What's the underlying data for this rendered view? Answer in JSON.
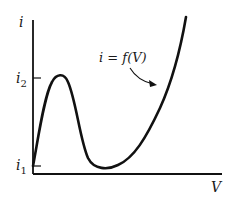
{
  "diagram": {
    "type": "current-voltage characteristic (N-shaped curve)",
    "axes": {
      "y_label": "i",
      "x_label": "V"
    },
    "ticks": {
      "i2": {
        "base": "i",
        "subscript": "2"
      },
      "i1": {
        "base": "i",
        "subscript": "1"
      }
    },
    "curve": {
      "label": "i = f(V)",
      "stroke_color": "#111111",
      "features": [
        "starts at i1 on vertical axis",
        "rises to local maximum at i2",
        "falls to local minimum near i1",
        "rises steeply beyond"
      ]
    },
    "colors": {
      "background": "#ffffff",
      "ink": "#111111"
    }
  }
}
